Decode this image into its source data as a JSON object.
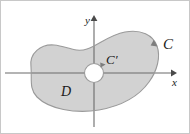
{
  "figure": {
    "type": "math-diagram",
    "labels": {
      "outer_curve": "C",
      "inner_curve": "C′",
      "region": "D",
      "x_axis": "x",
      "y_axis": "y"
    },
    "colors": {
      "region_fill": "#d2d2d2",
      "region_stroke": "#9a9a9a",
      "axis": "#6b6b6b",
      "hole_fill": "#ffffff",
      "label_text": "#1a1a1a",
      "frame_border": "#c8c8c8",
      "background": "#ffffff"
    },
    "geometry": {
      "origin": {
        "x": 93,
        "y": 72
      },
      "x_axis_span": [
        4,
        172
      ],
      "y_axis_span": [
        16,
        126
      ],
      "inner_hole": {
        "cx": 93,
        "cy": 72,
        "r": 9.5
      },
      "orientation_outer": "counterclockwise",
      "orientation_inner": "clockwise"
    },
    "annotations": [
      {
        "name": "outer-orientation-arrow",
        "at": {
          "x": 152,
          "y": 43
        }
      },
      {
        "name": "inner-orientation-arrow",
        "at": {
          "x": 101,
          "y": 64
        }
      }
    ]
  }
}
